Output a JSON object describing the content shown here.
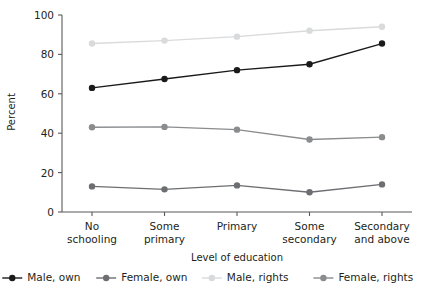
{
  "chart_data": {
    "type": "line",
    "title": "",
    "xlabel": "Level of education",
    "ylabel": "Percent",
    "ylim": [
      0,
      100
    ],
    "yticks": [
      0,
      20,
      40,
      60,
      80,
      100
    ],
    "grid": false,
    "legend_position": "bottom",
    "categories": [
      "No\nschooling",
      "Some\nprimary",
      "Primary",
      "Some\nsecondary",
      "Secondary\nand above"
    ],
    "category_lines": [
      [
        "No",
        "schooling"
      ],
      [
        "Some",
        "primary"
      ],
      [
        "Primary",
        ""
      ],
      [
        "Some",
        "secondary"
      ],
      [
        "Secondary",
        "and above"
      ]
    ],
    "series": [
      {
        "name": "Male, own",
        "color": "#1a1a1a",
        "values": [
          63.0,
          67.5,
          72.0,
          75.0,
          85.5
        ]
      },
      {
        "name": "Female, own",
        "color": "#6d6e71",
        "values": [
          13.0,
          11.5,
          13.5,
          10.0,
          14.0
        ]
      },
      {
        "name": "Male, rights",
        "color": "#d9dadb",
        "values": [
          85.5,
          87.0,
          89.0,
          92.0,
          94.0
        ]
      },
      {
        "name": "Female, rights",
        "color": "#8a8c8e",
        "values": [
          43.0,
          43.2,
          41.8,
          36.8,
          38.0
        ]
      }
    ]
  },
  "axis": {
    "y_tick_labels": [
      "0",
      "20",
      "40",
      "60",
      "80",
      "100"
    ],
    "y_title": "Percent",
    "x_title": "Level of education"
  },
  "legend": {
    "items": [
      {
        "label": "Male, own",
        "color": "#1a1a1a"
      },
      {
        "label": "Female, own",
        "color": "#6d6e71"
      },
      {
        "label": "Male, rights",
        "color": "#d9dadb"
      },
      {
        "label": "Female, rights",
        "color": "#8a8c8e"
      }
    ]
  }
}
